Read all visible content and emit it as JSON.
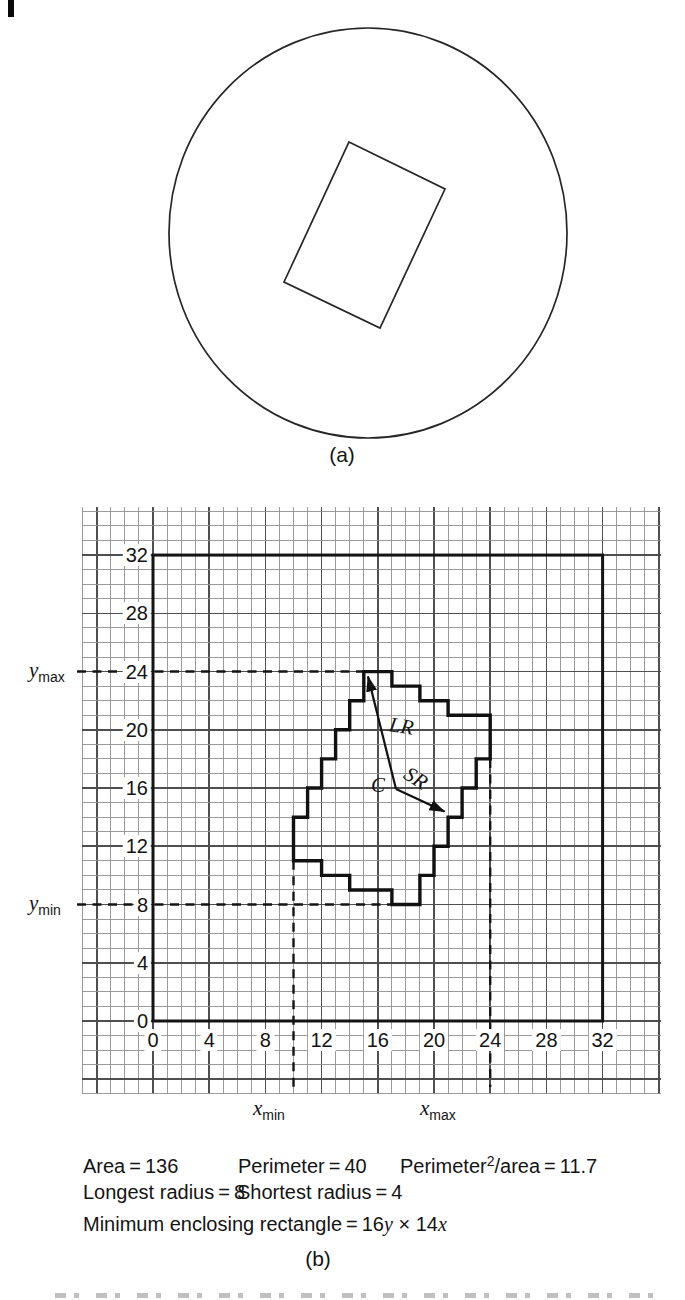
{
  "shared": {
    "equals": "="
  },
  "panel_a": {
    "caption": "(a)",
    "circle": {
      "cx": 368,
      "cy": 233,
      "rx": 199,
      "ry": 205
    },
    "rectangle_points": [
      [
        349,
        142
      ],
      [
        445,
        189
      ],
      [
        380,
        328
      ],
      [
        284,
        282
      ]
    ]
  },
  "panel_b": {
    "caption": "(b)",
    "grid": {
      "area": {
        "x0": 82,
        "y0": 507,
        "x1": 661,
        "y1": 1094
      },
      "origin_px": {
        "x": 153,
        "y": 1021
      },
      "unit_px": {
        "x": 14.05,
        "y": 14.56
      },
      "axis_min": 0,
      "axis_max": 32,
      "major_step": 4,
      "colors": {
        "fine": "#909090",
        "major": "#4f4f4f",
        "frame": "#141414",
        "shape": "#111111"
      }
    },
    "axis": {
      "tick_values": [
        0,
        4,
        8,
        12,
        16,
        20,
        24,
        28,
        32
      ]
    },
    "shape_outline_units": [
      [
        15,
        24
      ],
      [
        17,
        24
      ],
      [
        17,
        23
      ],
      [
        19,
        23
      ],
      [
        19,
        22
      ],
      [
        21,
        22
      ],
      [
        21,
        21
      ],
      [
        24,
        21
      ],
      [
        24,
        18
      ],
      [
        23,
        18
      ],
      [
        23,
        16
      ],
      [
        22,
        16
      ],
      [
        22,
        14
      ],
      [
        21,
        14
      ],
      [
        21,
        12
      ],
      [
        20,
        12
      ],
      [
        20,
        10
      ],
      [
        19,
        10
      ],
      [
        19,
        8
      ],
      [
        17,
        8
      ],
      [
        17,
        9
      ],
      [
        14,
        9
      ],
      [
        14,
        10
      ],
      [
        12,
        10
      ],
      [
        12,
        11
      ],
      [
        10,
        11
      ],
      [
        10,
        14
      ],
      [
        11,
        14
      ],
      [
        11,
        16
      ],
      [
        12,
        16
      ],
      [
        12,
        18
      ],
      [
        13,
        18
      ],
      [
        13,
        20
      ],
      [
        14,
        20
      ],
      [
        14,
        22
      ],
      [
        15,
        22
      ]
    ],
    "dashed_lines": [
      {
        "name": "y-max-line",
        "type": "h",
        "v": 24,
        "from_px": 77,
        "to_unit": 15
      },
      {
        "name": "y-min-line",
        "type": "h",
        "v": 8,
        "from_px": 77,
        "to_unit": 17
      },
      {
        "name": "x-min-line",
        "type": "v",
        "u": 10,
        "from_unit": 11,
        "to_px": 1087
      },
      {
        "name": "x-max-line",
        "type": "v",
        "u": 24,
        "from_unit": 18,
        "to_px": 1087
      }
    ],
    "extent_labels": {
      "y_max": {
        "base": "y",
        "sub": "max"
      },
      "y_min": {
        "base": "y",
        "sub": "min"
      },
      "x_min": {
        "base": "x",
        "sub": "min"
      },
      "x_max": {
        "base": "x",
        "sub": "max"
      }
    },
    "annotations": {
      "center_label": "C",
      "long_radius_label": "LR",
      "short_radius_label": "SR",
      "arrow_vertex": [
        396,
        789
      ],
      "lr_tip": [
        368,
        676.5
      ],
      "sr_tip": [
        444.5,
        811.5
      ]
    }
  },
  "stats": {
    "area": {
      "label": "Area",
      "value": "136"
    },
    "perimeter": {
      "label": "Perimeter",
      "value": "40"
    },
    "p2a": {
      "label_base": "Perimeter",
      "sup": "2",
      "label_rest": "/area",
      "value": "11.7"
    },
    "longest_radius": {
      "label": "Longest radius",
      "value": "8"
    },
    "shortest_radius": {
      "label": "Shortest radius",
      "value": "4"
    },
    "mer": {
      "label": "Minimum enclosing rectangle",
      "v1": "16",
      "i1": "y",
      "times": "×",
      "v2": "14",
      "i2": "x"
    }
  }
}
